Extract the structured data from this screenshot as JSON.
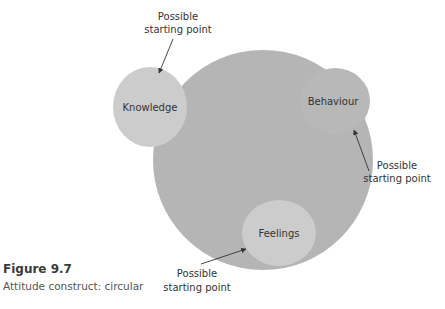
{
  "figure": {
    "number": "Figure 9.7",
    "caption": "Attitude construct: circular"
  },
  "diagram": {
    "central_circle": {
      "color": "#b5b5b5"
    },
    "nodes": [
      {
        "id": "knowledge",
        "label": "Knowledge",
        "color": "#cccccc"
      },
      {
        "id": "behaviour",
        "label": "Behaviour",
        "color": "#b8b8b8"
      },
      {
        "id": "feelings",
        "label": "Feelings",
        "color": "#cccccc"
      }
    ],
    "annotations": [
      {
        "target": "knowledge",
        "line1": "Possible",
        "line2": "starting point"
      },
      {
        "target": "behaviour",
        "line1": "Possible",
        "line2": "starting point"
      },
      {
        "target": "feelings",
        "line1": "Possible",
        "line2": "starting point"
      }
    ],
    "arrow_color": "#333333"
  }
}
